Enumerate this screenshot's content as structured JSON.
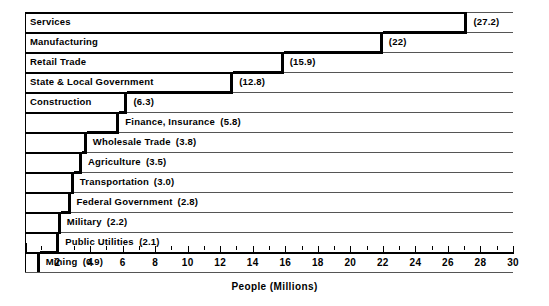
{
  "chart_data": {
    "type": "bar",
    "orientation": "horizontal",
    "title": "",
    "xlabel": "People (Millions)",
    "ylabel": "",
    "xlim": [
      0,
      30
    ],
    "xticks": [
      2,
      4,
      6,
      8,
      10,
      12,
      14,
      16,
      18,
      20,
      22,
      24,
      26,
      28,
      30
    ],
    "xtick_labels": [
      "2",
      "4",
      "6",
      "8",
      "10",
      "12",
      "14",
      "16",
      "18",
      "20",
      "22",
      "24",
      "26",
      "28",
      "30"
    ],
    "grid": false,
    "legend": false,
    "categories": [
      "Services",
      "Manufacturing",
      "Retail Trade",
      "State & Local Government",
      "Construction",
      "Finance, Insurance",
      "Wholesale Trade",
      "Agriculture",
      "Transportation",
      "Federal Government",
      "Military",
      "Public Utilities",
      "Mining"
    ],
    "values": [
      27.2,
      22,
      15.9,
      12.8,
      6.3,
      5.8,
      3.8,
      3.5,
      3.0,
      2.8,
      2.2,
      2.1,
      0.9
    ],
    "value_labels": [
      "(27.2)",
      "(22)",
      "(15.9)",
      "(12.8)",
      "(6.3)",
      "(5.8)",
      "(3.8)",
      "(3.5)",
      "(3.0)",
      "(2.8)",
      "(2.2)",
      "(2.1)",
      "(0.9)"
    ]
  },
  "axis": {
    "xlabel": "People (Millions)"
  },
  "rows": [
    {
      "label": "Services",
      "value_label": "(27.2)",
      "value": 27.2,
      "label_inside": true,
      "row": 0
    },
    {
      "label": "Manufacturing",
      "value_label": "(22)",
      "value": 22,
      "label_inside": true,
      "row": 1
    },
    {
      "label": "Retail Trade",
      "value_label": "(15.9)",
      "value": 15.9,
      "label_inside": true,
      "row": 2
    },
    {
      "label": "State & Local Government",
      "value_label": "(12.8)",
      "value": 12.8,
      "label_inside": true,
      "row": 3
    },
    {
      "label": "Construction",
      "value_label": "(6.3)",
      "value": 6.3,
      "label_inside": true,
      "row": 4
    },
    {
      "label": "Finance, Insurance",
      "value_label": "(5.8)",
      "value": 5.8,
      "label_inside": false,
      "row": 5
    },
    {
      "label": "Wholesale Trade",
      "value_label": "(3.8)",
      "value": 3.8,
      "label_inside": false,
      "row": 6
    },
    {
      "label": "Agriculture",
      "value_label": "(3.5)",
      "value": 3.5,
      "label_inside": false,
      "row": 7
    },
    {
      "label": "Transportation",
      "value_label": "(3.0)",
      "value": 3.0,
      "label_inside": false,
      "row": 8
    },
    {
      "label": "Federal Government",
      "value_label": "(2.8)",
      "value": 2.8,
      "label_inside": false,
      "row": 9
    },
    {
      "label": "Military",
      "value_label": "(2.2)",
      "value": 2.2,
      "label_inside": false,
      "row": 10
    },
    {
      "label": "Public Utilities",
      "value_label": "(2.1)",
      "value": 2.1,
      "label_inside": false,
      "row": 11
    },
    {
      "label": "Mining",
      "value_label": "(0.9)",
      "value": 0.9,
      "label_inside": false,
      "row": 12
    }
  ],
  "colors": {
    "bar_outline": "#000000",
    "frame": "#555555",
    "background": "#ffffff",
    "text": "#000000"
  }
}
